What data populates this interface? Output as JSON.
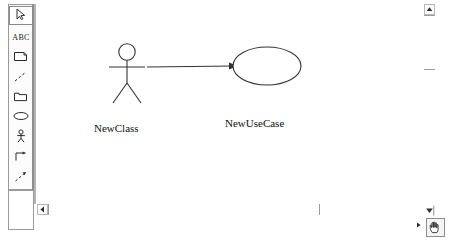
{
  "app": {
    "title": "UML Use Case Diagram Editor",
    "canvas_background": "#ffffff",
    "stroke_color": "#333333"
  },
  "toolbar": {
    "name": "drawing-toolbar",
    "orientation": "vertical",
    "selected_index": 0,
    "items": [
      {
        "icon": "selector-arrow-icon",
        "label": "Selection Tool",
        "selected": true
      },
      {
        "icon": "abc-text-icon",
        "label": "ABC",
        "text": "ABC",
        "selected": false
      },
      {
        "icon": "note-icon",
        "label": "Note",
        "selected": false
      },
      {
        "icon": "note-anchor-icon",
        "label": "Anchor Note to Item",
        "selected": false
      },
      {
        "icon": "package-icon",
        "label": "Package",
        "selected": false
      },
      {
        "icon": "use-case-ellipse-icon",
        "label": "Use Case",
        "selected": false
      },
      {
        "icon": "actor-stick-figure-icon",
        "label": "Actor",
        "selected": false
      },
      {
        "icon": "unidirectional-association-icon",
        "label": "Unidirectional Association",
        "selected": false
      },
      {
        "icon": "dependency-arrow-icon",
        "label": "Dependency or Instantiates",
        "selected": false
      },
      {
        "icon": "generalization-arrow-icon",
        "label": "Generalization",
        "selected": false
      }
    ]
  },
  "diagram": {
    "name": "use-case-diagram",
    "actor": {
      "label": "NewClass",
      "shape": "stick-figure"
    },
    "use_case": {
      "label": "NewUseCase",
      "shape": "ellipse"
    },
    "association": {
      "label": "",
      "type": "unidirectional-association",
      "from": "NewClass",
      "to": "NewUseCase"
    }
  },
  "scrollbars": {
    "horizontal": {
      "name": "horizontal-scrollbar",
      "left_arrow": "◀",
      "right_arrow": "▶",
      "thumb_position": 0
    },
    "vertical": {
      "name": "vertical-scrollbar",
      "up_arrow": "▲",
      "down_arrow": "▼",
      "thumb_position": 0
    }
  },
  "status": {
    "pan_tool_icon": "hand-icon"
  }
}
